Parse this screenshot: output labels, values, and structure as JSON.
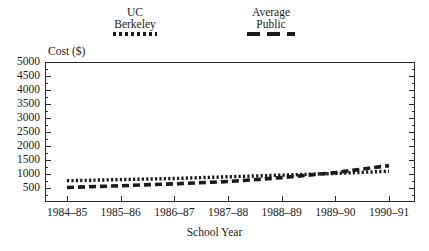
{
  "legend": {
    "entries": [
      {
        "line1": "UC",
        "line2": "Berkeley",
        "style": "dotted"
      },
      {
        "line1": "Average",
        "line2": "Public",
        "style": "dashed"
      }
    ]
  },
  "axes": {
    "y_title": "Cost ($)",
    "x_title": "School Year",
    "y_ticks": [
      "5000",
      "4500",
      "4000",
      "3500",
      "3000",
      "2500",
      "2000",
      "1500",
      "1000",
      "500"
    ],
    "x_ticks": [
      "1984–85",
      "1985–86",
      "1986–87",
      "1987–88",
      "1988–89",
      "1989–90",
      "1990–91"
    ]
  },
  "colors": {
    "ink": "#1a1a1a",
    "frame": "#2a2a2a",
    "background": "#ffffff"
  },
  "chart_data": {
    "type": "line",
    "title": "",
    "xlabel": "School Year",
    "ylabel": "Cost ($)",
    "categories": [
      "1984–85",
      "1985–86",
      "1986–87",
      "1987–88",
      "1988–89",
      "1989–90",
      "1990–91"
    ],
    "x": [
      1984,
      1985,
      1986,
      1987,
      1988,
      1989,
      1990
    ],
    "ylim": [
      0,
      5000
    ],
    "ytick_step": 500,
    "grid": false,
    "legend_position": "top",
    "series": [
      {
        "name": "UC Berkeley",
        "linestyle": "dotted",
        "values": [
          760,
          800,
          840,
          900,
          960,
          1020,
          1100
        ]
      },
      {
        "name": "Average Public",
        "linestyle": "dashed",
        "values": [
          520,
          580,
          650,
          730,
          870,
          1050,
          1300
        ]
      }
    ],
    "annotations": [
      "Average Public crosses above UC Berkeley near 1988–89"
    ]
  }
}
